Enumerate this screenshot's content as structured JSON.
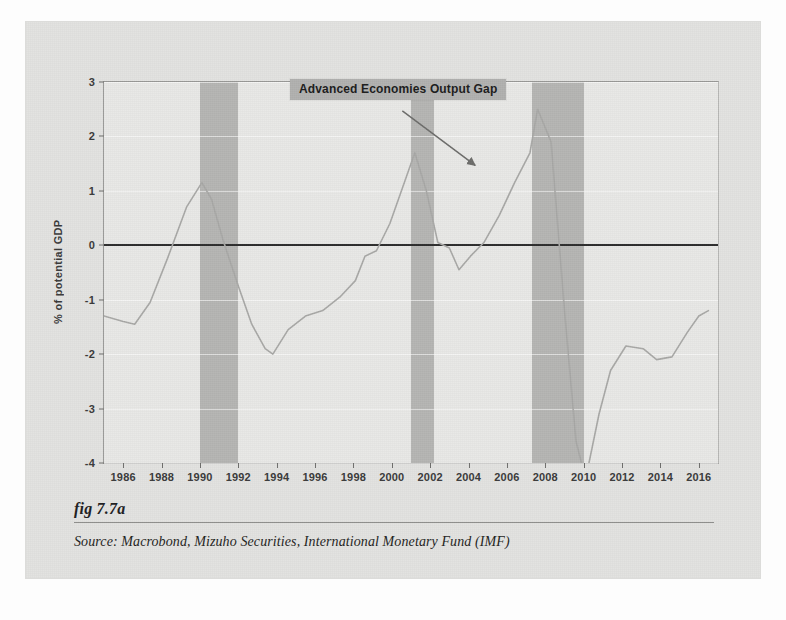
{
  "figure": {
    "caption": "fig 7.7a",
    "source": "Source:  Macrobond, Mizuho Securities, International Monetary Fund (IMF)"
  },
  "colors": {
    "panel_background": "#e3e3e1",
    "plot_background": "#e9e9e7",
    "recession_band": "#b6b6b4",
    "series_line": "#a9a9a7",
    "zero_line": "#2e2e2e",
    "label_background": "#b2b2b0",
    "axis_text": "#3a3a3a"
  },
  "chart_data": {
    "type": "line",
    "title": "Advanced Economies Output Gap",
    "xlabel": "",
    "ylabel": "% of potential GDP",
    "xlim": [
      1985,
      2017
    ],
    "ylim": [
      -4,
      3
    ],
    "grid": true,
    "legend_position": "inside-top-center",
    "xticks": [
      1986,
      1988,
      1990,
      1992,
      1994,
      1996,
      1998,
      2000,
      2002,
      2004,
      2006,
      2008,
      2010,
      2012,
      2014,
      2016
    ],
    "yticks": [
      3,
      2,
      1,
      0,
      -1,
      -2,
      -3,
      -4
    ],
    "annotations": [
      {
        "text": "Advanced Economies Output Gap",
        "type": "label-with-arrow",
        "arrow_from_year": 2000.6,
        "arrow_from_value": 2.45,
        "arrow_to_year": 2004.4,
        "arrow_to_value": 1.45
      }
    ],
    "shaded_regions": [
      {
        "name": "recession-1990-1992",
        "start": 1990.0,
        "end": 1992.0
      },
      {
        "name": "recession-2001-2002",
        "start": 2001.0,
        "end": 2002.2
      },
      {
        "name": "recession-2007-2010",
        "start": 2007.3,
        "end": 2010.0
      }
    ],
    "series": [
      {
        "name": "Advanced Economies Output Gap",
        "color": "#a9a9a7",
        "x": [
          1985.0,
          1986.0,
          1986.6,
          1987.4,
          1988.3,
          1989.3,
          1990.1,
          1990.6,
          1991.2,
          1992.0,
          1992.7,
          1993.4,
          1993.8,
          1994.6,
          1995.5,
          1996.4,
          1997.3,
          1998.1,
          1998.6,
          1999.2,
          1999.9,
          2000.7,
          2001.2,
          2001.8,
          2002.4,
          2003.0,
          2003.5,
          2004.1,
          2004.8,
          2005.6,
          2006.4,
          2007.2,
          2007.6,
          2008.3,
          2009.0,
          2009.6,
          2010.1,
          2010.8,
          2011.4,
          2012.2,
          2013.1,
          2013.8,
          2014.6,
          2015.4,
          2016.0,
          2016.5
        ],
        "y": [
          -1.3,
          -1.4,
          -1.45,
          -1.05,
          -0.25,
          0.7,
          1.15,
          0.85,
          0.1,
          -0.75,
          -1.45,
          -1.9,
          -2.0,
          -1.55,
          -1.3,
          -1.2,
          -0.95,
          -0.65,
          -0.2,
          -0.1,
          0.4,
          1.2,
          1.7,
          1.0,
          0.05,
          -0.05,
          -0.45,
          -0.2,
          0.05,
          0.55,
          1.15,
          1.7,
          2.5,
          1.9,
          -1.2,
          -3.6,
          -4.3,
          -3.1,
          -2.3,
          -1.85,
          -1.9,
          -2.1,
          -2.05,
          -1.6,
          -1.3,
          -1.2
        ]
      }
    ]
  }
}
